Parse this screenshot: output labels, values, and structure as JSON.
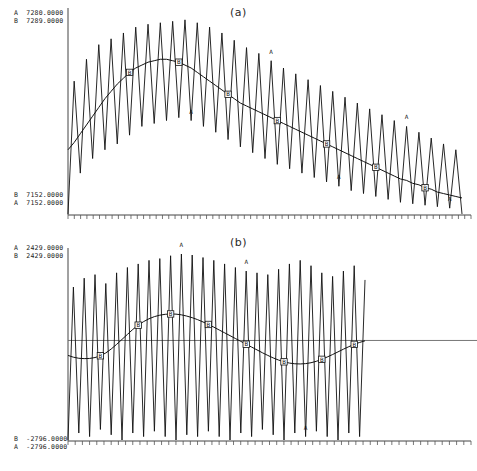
{
  "figure": {
    "background": "#ffffff",
    "ink": "#111111",
    "panels": [
      "a",
      "b"
    ]
  },
  "panel_a": {
    "title": "(a)",
    "labels_top": [
      "A  7280.0000",
      "B  7289.0000"
    ],
    "labels_bottom": [
      "B  7152.0000",
      "A  7152.0000"
    ],
    "series_marker_a": "A",
    "series_marker_b": "B"
  },
  "panel_b": {
    "title": "(b)",
    "labels_top": [
      "A  2429.0000",
      "B  2429.0000"
    ],
    "labels_bottom": [
      "B  -2796.0000",
      "A  -2796.0000"
    ],
    "series_marker_a": "A",
    "series_marker_b": "B"
  },
  "chart_data": [
    {
      "type": "line",
      "panel": "a",
      "title": "(a)",
      "xlabel": "",
      "ylabel": "",
      "grid": false,
      "legend": "inline-glyphs",
      "axis_top_labels": [
        "A  7280.0000",
        "B  7289.0000"
      ],
      "axis_bottom_labels": [
        "B  7152.0000",
        "A  7152.0000"
      ],
      "ylim": [
        7152.0,
        7289.0
      ],
      "xlim": [
        0,
        64
      ],
      "tick_count": 64,
      "series": [
        {
          "name": "A",
          "style": "high-frequency-zigzag",
          "glyph": "A",
          "values": [
            7152,
            7243,
            7180,
            7258,
            7190,
            7268,
            7196,
            7272,
            7200,
            7276,
            7206,
            7280,
            7212,
            7282,
            7214,
            7283,
            7216,
            7284,
            7218,
            7285,
            7216,
            7283,
            7212,
            7280,
            7208,
            7276,
            7203,
            7271,
            7198,
            7266,
            7194,
            7262,
            7190,
            7257,
            7186,
            7252,
            7183,
            7248,
            7180,
            7244,
            7177,
            7240,
            7174,
            7236,
            7171,
            7232,
            7168,
            7228,
            7166,
            7224,
            7164,
            7220,
            7162,
            7216,
            7160,
            7212,
            7159,
            7208,
            7158,
            7204,
            7157,
            7200,
            7156,
            7196,
            7152
          ]
        },
        {
          "name": "B",
          "style": "smooth-trend",
          "glyph": "B",
          "values": [
            7196,
            7201,
            7207,
            7213,
            7219,
            7225,
            7231,
            7236,
            7241,
            7245,
            7249,
            7252,
            7254,
            7256,
            7257,
            7258,
            7258,
            7257,
            7256,
            7254,
            7252,
            7249,
            7246,
            7243,
            7240,
            7237,
            7234,
            7231,
            7228,
            7226,
            7224,
            7222,
            7220,
            7218,
            7216,
            7214,
            7212,
            7210,
            7208,
            7206,
            7204,
            7202,
            7200,
            7198,
            7196,
            7194,
            7192,
            7190,
            7188,
            7186,
            7184,
            7182,
            7180,
            7178,
            7176,
            7175,
            7173,
            7172,
            7170,
            7169,
            7167,
            7166,
            7165,
            7164,
            7163
          ],
          "markers_at": [
            10,
            18,
            26,
            34,
            42,
            50,
            58
          ]
        }
      ],
      "a_glyph_peaks": [
        20,
        33,
        44,
        55,
        62
      ]
    },
    {
      "type": "line",
      "panel": "b",
      "title": "(b)",
      "xlabel": "",
      "ylabel": "",
      "grid": false,
      "zero_line": 0,
      "legend": "inline-glyphs",
      "axis_top_labels": [
        "A  2429.0000",
        "B  2429.0000"
      ],
      "axis_bottom_labels": [
        "B  -2796.0000",
        "A  -2796.0000"
      ],
      "ylim": [
        -2796.0,
        2429.0
      ],
      "xlim": [
        0,
        56
      ],
      "tick_count": 56,
      "series": [
        {
          "name": "A",
          "style": "high-frequency-oscillation",
          "glyph": "A",
          "values": [
            -2796,
            1500,
            -2600,
            1750,
            -2700,
            1850,
            -2500,
            1600,
            -2650,
            1900,
            -2796,
            2050,
            -2600,
            2150,
            -2700,
            2250,
            -2550,
            2300,
            -2700,
            2380,
            -2796,
            2429,
            -2650,
            2400,
            -2700,
            2330,
            -2550,
            2250,
            -2700,
            2150,
            -2796,
            2050,
            -2600,
            1950,
            -2700,
            1900,
            -2500,
            1850,
            -2650,
            2000,
            -2796,
            2150,
            -2600,
            2250,
            -2700,
            2100,
            -2550,
            1900,
            -2700,
            1800,
            -2796,
            1950,
            -2600,
            2100,
            -2700,
            1700
          ]
        },
        {
          "name": "B",
          "style": "smooth-sinusoid",
          "glyph": "B",
          "values": [
            -420,
            -470,
            -500,
            -510,
            -505,
            -480,
            -430,
            -350,
            -240,
            -110,
            30,
            170,
            310,
            430,
            530,
            610,
            670,
            710,
            735,
            745,
            740,
            720,
            685,
            640,
            585,
            520,
            450,
            375,
            295,
            215,
            135,
            55,
            -25,
            -105,
            -185,
            -265,
            -345,
            -420,
            -490,
            -550,
            -600,
            -635,
            -655,
            -660,
            -650,
            -625,
            -585,
            -530,
            -465,
            -395,
            -320,
            -245,
            -175,
            -110,
            -55,
            -10
          ],
          "markers_at": [
            6,
            13,
            19,
            26,
            33,
            40,
            47,
            53
          ]
        }
      ],
      "a_glyph_peaks": [
        21,
        33,
        44
      ]
    }
  ]
}
